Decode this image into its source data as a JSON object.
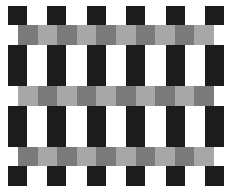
{
  "figure": {
    "width": 228,
    "height": 196,
    "colors": {
      "background": "#ffffff",
      "black": "#1c1c1c",
      "gray_dark": "#7a7a7a",
      "gray_light": "#a7a7a7"
    },
    "columns_x": [
      8,
      47,
      87,
      126,
      166,
      205
    ],
    "column_width": 19,
    "black_rows": [
      {
        "y": 6,
        "height": 19
      },
      {
        "y": 45,
        "height": 41
      },
      {
        "y": 106,
        "height": 41
      },
      {
        "y": 166,
        "height": 20
      }
    ],
    "bands": [
      {
        "y": 25,
        "height": 20,
        "x": 18,
        "cell_width": 19.6,
        "cells": 10,
        "start": "dark"
      },
      {
        "y": 86,
        "height": 20,
        "x": 18,
        "cell_width": 19.6,
        "cells": 10,
        "start": "light"
      },
      {
        "y": 147,
        "height": 19,
        "x": 18,
        "cell_width": 19.6,
        "cells": 10,
        "start": "dark"
      }
    ]
  }
}
